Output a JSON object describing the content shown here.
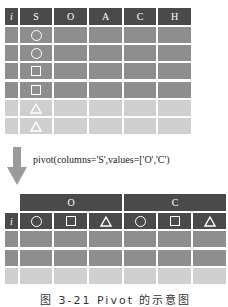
{
  "top_table": {
    "headers": [
      "i",
      "S",
      "O",
      "A",
      "C",
      "H"
    ],
    "rows": [
      {
        "S": "circle",
        "shade": "dark"
      },
      {
        "S": "circle",
        "shade": "dark"
      },
      {
        "S": "square",
        "shade": "dark"
      },
      {
        "S": "square",
        "shade": "dark"
      },
      {
        "S": "triangle",
        "shade": "light"
      },
      {
        "S": "triangle",
        "shade": "light"
      }
    ]
  },
  "operation": {
    "arrow_icon": "down-arrow",
    "label": "pivot(columns='S',values=['O','C')"
  },
  "bottom_table": {
    "group_headers": [
      "O",
      "C"
    ],
    "index_header": "i",
    "sub_headers": [
      "circle",
      "square",
      "triangle",
      "circle",
      "square",
      "triangle"
    ],
    "rows": [
      {
        "shade": "dark"
      },
      {
        "shade": "dark"
      },
      {
        "shade": "light"
      }
    ]
  },
  "caption": "图 3-21  Pivot 的示意图",
  "colors": {
    "header": "#4a4a4a",
    "dark_row": "#8e8e8e",
    "light_row": "#cfcfcf",
    "arrow": "#9a9a9a"
  }
}
